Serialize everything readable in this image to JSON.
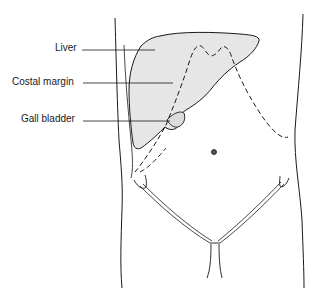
{
  "figure": {
    "type": "anatomical-diagram",
    "labels": [
      {
        "text": "Liver",
        "x": 55,
        "y": 42
      },
      {
        "text": "Costal margin",
        "x": 12,
        "y": 76
      },
      {
        "text": "Gall bladder",
        "x": 21,
        "y": 113
      }
    ],
    "colors": {
      "outline": "#1a1a1a",
      "liver_fill": "#e6e6e6",
      "background": "#ffffff"
    }
  }
}
